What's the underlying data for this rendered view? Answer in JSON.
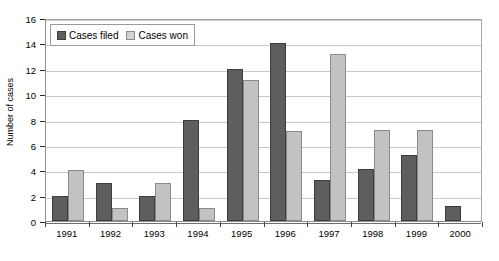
{
  "chart_data": {
    "type": "bar",
    "title": "",
    "xlabel": "",
    "ylabel": "Number of cases",
    "ylim": [
      0,
      16
    ],
    "ytick_step": 2,
    "yticks": [
      "0",
      "2",
      "4",
      "6",
      "8",
      "10",
      "12",
      "14",
      "16"
    ],
    "grid": true,
    "legend_position": "top-left-inside",
    "categories": [
      "1991",
      "1992",
      "1993",
      "1994",
      "1995",
      "1996",
      "1997",
      "1998",
      "1999",
      "2000"
    ],
    "series": [
      {
        "name": "Cases filed",
        "color": "#5e5e5e",
        "values": [
          2,
          3,
          2,
          8,
          12,
          14,
          3.2,
          4.1,
          5.2,
          1.2
        ]
      },
      {
        "name": "Cases won",
        "color": "#c2c2c2",
        "values": [
          4,
          1,
          3,
          1,
          11.1,
          7.1,
          13.2,
          7.2,
          7.2,
          0
        ]
      }
    ]
  },
  "legend": {
    "entries": [
      {
        "label": "Cases filed",
        "swatch": "dark-square-icon"
      },
      {
        "label": "Cases won",
        "swatch": "light-square-icon"
      }
    ]
  },
  "axes": {
    "y_title": "Number of cases"
  }
}
